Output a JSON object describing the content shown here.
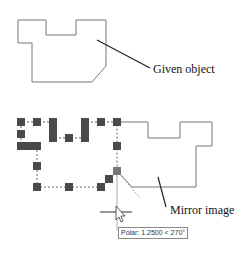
{
  "labels": {
    "given": "Given object",
    "mirror": "Mirror image"
  },
  "tooltip": {
    "text": "Polar: 1.2500 < 270°"
  },
  "colors": {
    "outline": "#777777",
    "grip": "#4a4a4a",
    "leader": "#222222"
  }
}
